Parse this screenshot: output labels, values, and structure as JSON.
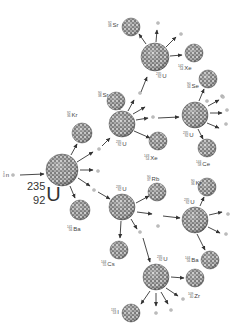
{
  "diagram": {
    "colors": {
      "nucleus_fill": "#8a8a8a",
      "nucleus_dark": "#4a4a4a",
      "nucleus_light": "#cfcfcf",
      "arrow": "#333333",
      "neutron": "#bdbdbd",
      "text": "#444444",
      "background": "#ffffff"
    },
    "incoming_neutron": {
      "symbol": "n",
      "mass": "1",
      "z": "0",
      "x": 13,
      "y": 175
    },
    "initial_nucleus": {
      "symbol": "U",
      "mass": "235",
      "z": "92",
      "x": 62,
      "y": 170,
      "r": 16
    },
    "nuclei": [
      {
        "id": "kr1",
        "symbol": "Kr",
        "mass": "92",
        "z": "36",
        "x": 82,
        "y": 133,
        "r": 10,
        "label_x": 67,
        "label_y": 112
      },
      {
        "id": "ba1",
        "symbol": "Ba",
        "mass": "141",
        "z": "56",
        "x": 80,
        "y": 210,
        "r": 10,
        "label_x": 67,
        "label_y": 226
      },
      {
        "id": "u2",
        "symbol": "U",
        "mass": "235",
        "z": "92",
        "x": 122,
        "y": 124,
        "r": 13,
        "label_x": 116,
        "label_y": 141
      },
      {
        "id": "sr1",
        "symbol": "Sr",
        "mass": "90",
        "z": "38",
        "x": 116,
        "y": 101,
        "r": 9,
        "label_x": 98,
        "label_y": 92
      },
      {
        "id": "xe1",
        "symbol": "Xe",
        "mass": "143",
        "z": "54",
        "x": 158,
        "y": 141,
        "r": 9,
        "label_x": 144,
        "label_y": 155
      },
      {
        "id": "u3",
        "symbol": "U",
        "mass": "235",
        "z": "92",
        "x": 155,
        "y": 57,
        "r": 14,
        "label_x": 156,
        "label_y": 73
      },
      {
        "id": "sr2",
        "symbol": "Sr",
        "mass": "92",
        "z": "38",
        "x": 131,
        "y": 27,
        "r": 9,
        "label_x": 108,
        "label_y": 22
      },
      {
        "id": "xe2",
        "symbol": "Xe",
        "mass": "142",
        "z": "54",
        "x": 194,
        "y": 53,
        "r": 9,
        "label_x": 178,
        "label_y": 65
      },
      {
        "id": "se1",
        "symbol": "Se",
        "mass": "90",
        "z": "34",
        "x": 208,
        "y": 79,
        "r": 9,
        "label_x": 187,
        "label_y": 83
      },
      {
        "id": "u4",
        "symbol": "U",
        "mass": "235",
        "z": "92",
        "x": 195,
        "y": 115,
        "r": 13,
        "label_x": 183,
        "label_y": 132
      },
      {
        "id": "ce1",
        "symbol": "Ce",
        "mass": "144",
        "z": "58",
        "x": 207,
        "y": 148,
        "r": 9,
        "label_x": 196,
        "label_y": 161
      },
      {
        "id": "u5",
        "symbol": "U",
        "mass": "235",
        "z": "92",
        "x": 122,
        "y": 207,
        "r": 13,
        "label_x": 116,
        "label_y": 186
      },
      {
        "id": "rb1",
        "symbol": "Rb",
        "mass": "90",
        "z": "37",
        "x": 157,
        "y": 192,
        "r": 9,
        "label_x": 147,
        "label_y": 176
      },
      {
        "id": "cs1",
        "symbol": "Cs",
        "mass": "144",
        "z": "55",
        "x": 119,
        "y": 250,
        "r": 9,
        "label_x": 101,
        "label_y": 261
      },
      {
        "id": "u6",
        "symbol": "U",
        "mass": "235",
        "z": "92",
        "x": 195,
        "y": 220,
        "r": 13,
        "label_x": 184,
        "label_y": 199
      },
      {
        "id": "kr2",
        "symbol": "Kr",
        "mass": "90",
        "z": "36",
        "x": 207,
        "y": 187,
        "r": 9,
        "label_x": 191,
        "label_y": 180
      },
      {
        "id": "ba2",
        "symbol": "Ba",
        "mass": "144",
        "z": "56",
        "x": 210,
        "y": 260,
        "r": 9,
        "label_x": 185,
        "label_y": 257
      },
      {
        "id": "u7",
        "symbol": "U",
        "mass": "235",
        "z": "92",
        "x": 156,
        "y": 277,
        "r": 13,
        "label_x": 157,
        "label_y": 256
      },
      {
        "id": "zr1",
        "symbol": "Zr",
        "mass": "109",
        "z": "40",
        "x": 195,
        "y": 278,
        "r": 9,
        "label_x": 188,
        "label_y": 293
      },
      {
        "id": "i1",
        "symbol": "I",
        "mass": "131",
        "z": "53",
        "x": 131,
        "y": 313,
        "r": 9,
        "label_x": 111,
        "label_y": 309
      }
    ],
    "neutrons": [
      {
        "x": 99,
        "y": 149
      },
      {
        "x": 98,
        "y": 171
      },
      {
        "x": 94,
        "y": 190
      },
      {
        "x": 140,
        "y": 93
      },
      {
        "x": 153,
        "y": 117
      },
      {
        "x": 158,
        "y": 23
      },
      {
        "x": 181,
        "y": 34
      },
      {
        "x": 222,
        "y": 96
      },
      {
        "x": 227,
        "y": 110
      },
      {
        "x": 226,
        "y": 124
      },
      {
        "x": 223,
        "y": 97
      },
      {
        "x": 158,
        "y": 226
      },
      {
        "x": 228,
        "y": 214
      },
      {
        "x": 226,
        "y": 234
      },
      {
        "x": 140,
        "y": 232
      },
      {
        "x": 183,
        "y": 299
      },
      {
        "x": 156,
        "y": 313
      },
      {
        "x": 171,
        "y": 310
      },
      {
        "x": 207,
        "y": 101
      }
    ],
    "arrows": [
      {
        "x1": 20,
        "y1": 175,
        "x2": 44,
        "y2": 174
      },
      {
        "x1": 71,
        "y1": 155,
        "x2": 77,
        "y2": 144
      },
      {
        "x1": 77,
        "y1": 162,
        "x2": 93,
        "y2": 152
      },
      {
        "x1": 80,
        "y1": 170,
        "x2": 93,
        "y2": 170
      },
      {
        "x1": 78,
        "y1": 178,
        "x2": 90,
        "y2": 186
      },
      {
        "x1": 70,
        "y1": 186,
        "x2": 75,
        "y2": 198
      },
      {
        "x1": 102,
        "y1": 146,
        "x2": 110,
        "y2": 138
      },
      {
        "x1": 120,
        "y1": 110,
        "x2": 119,
        "y2": 102
      },
      {
        "x1": 128,
        "y1": 111,
        "x2": 134,
        "y2": 100
      },
      {
        "x1": 133,
        "y1": 114,
        "x2": 145,
        "y2": 107
      },
      {
        "x1": 136,
        "y1": 120,
        "x2": 148,
        "y2": 118
      },
      {
        "x1": 134,
        "y1": 131,
        "x2": 150,
        "y2": 138
      },
      {
        "x1": 141,
        "y1": 92,
        "x2": 147,
        "y2": 77
      },
      {
        "x1": 146,
        "y1": 44,
        "x2": 139,
        "y2": 34
      },
      {
        "x1": 156,
        "y1": 42,
        "x2": 157,
        "y2": 30
      },
      {
        "x1": 166,
        "y1": 47,
        "x2": 176,
        "y2": 37
      },
      {
        "x1": 170,
        "y1": 56,
        "x2": 182,
        "y2": 55
      },
      {
        "x1": 158,
        "y1": 118,
        "x2": 179,
        "y2": 117
      },
      {
        "x1": 199,
        "y1": 101,
        "x2": 204,
        "y2": 89
      },
      {
        "x1": 208,
        "y1": 106,
        "x2": 219,
        "y2": 100
      },
      {
        "x1": 210,
        "y1": 113,
        "x2": 222,
        "y2": 113
      },
      {
        "x1": 207,
        "y1": 123,
        "x2": 219,
        "y2": 128
      },
      {
        "x1": 198,
        "y1": 129,
        "x2": 203,
        "y2": 139
      },
      {
        "x1": 98,
        "y1": 192,
        "x2": 110,
        "y2": 199
      },
      {
        "x1": 136,
        "y1": 203,
        "x2": 149,
        "y2": 196
      },
      {
        "x1": 137,
        "y1": 212,
        "x2": 152,
        "y2": 214
      },
      {
        "x1": 163,
        "y1": 216,
        "x2": 180,
        "y2": 218
      },
      {
        "x1": 121,
        "y1": 221,
        "x2": 120,
        "y2": 238
      },
      {
        "x1": 131,
        "y1": 219,
        "x2": 137,
        "y2": 229
      },
      {
        "x1": 143,
        "y1": 238,
        "x2": 150,
        "y2": 262
      },
      {
        "x1": 200,
        "y1": 206,
        "x2": 204,
        "y2": 197
      },
      {
        "x1": 209,
        "y1": 215,
        "x2": 222,
        "y2": 212
      },
      {
        "x1": 208,
        "y1": 227,
        "x2": 220,
        "y2": 233
      },
      {
        "x1": 197,
        "y1": 234,
        "x2": 205,
        "y2": 250
      },
      {
        "x1": 171,
        "y1": 277,
        "x2": 184,
        "y2": 278
      },
      {
        "x1": 150,
        "y1": 291,
        "x2": 141,
        "y2": 304
      },
      {
        "x1": 156,
        "y1": 293,
        "x2": 156,
        "y2": 306
      },
      {
        "x1": 161,
        "y1": 292,
        "x2": 168,
        "y2": 304
      },
      {
        "x1": 166,
        "y1": 288,
        "x2": 178,
        "y2": 296
      }
    ],
    "caption": ""
  }
}
